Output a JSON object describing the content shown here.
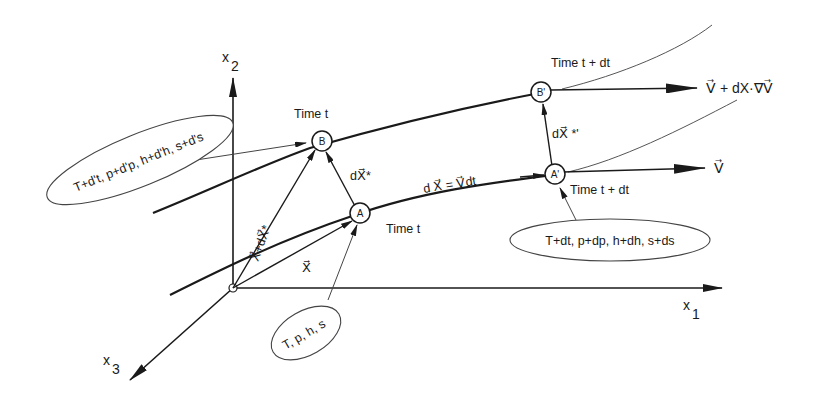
{
  "diagram": {
    "type": "kinematics-of-fluid-particles",
    "axes": {
      "x1": {
        "label": "x",
        "subscript": "1"
      },
      "x2": {
        "label": "x",
        "subscript": "2"
      },
      "x3": {
        "label": "x",
        "subscript": "3"
      }
    },
    "nodes": {
      "A": {
        "label": "A",
        "time": "Time t"
      },
      "B": {
        "label": "B",
        "time": "Time t"
      },
      "A_prime": {
        "label": "A'",
        "time": "Time t + dt"
      },
      "B_prime": {
        "label": "B'",
        "time": "Time t + dt"
      }
    },
    "vectors": {
      "X": "X⃗",
      "X_plus_dX_star": "X⃗+dX⃗*",
      "dX_star": "dX⃗*",
      "dX_star_prime": "dX⃗ *'",
      "dX_eq_Vdt": "d X⃗ = V⃗dt"
    },
    "velocities": {
      "V": "V⃗",
      "V_plus_grad": "V⃗ + dX·∇V⃗"
    },
    "ellipses": {
      "state_A": "T, p, h, s",
      "state_B": "T+d't, p+d'p, h+d'h, s+d's",
      "state_A_prime": "T+dt, p+dp,  h+dh, s+ds"
    }
  }
}
